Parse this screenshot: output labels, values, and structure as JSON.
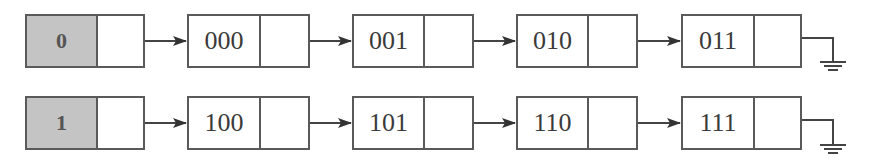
{
  "diagram": {
    "type": "hash-bucket-linked-lists",
    "lists": [
      {
        "head": {
          "label": "0",
          "fill": "#c4c4c4"
        },
        "nodes": [
          {
            "label": "000"
          },
          {
            "label": "001"
          },
          {
            "label": "010"
          },
          {
            "label": "011"
          }
        ],
        "terminator": "ground-null"
      },
      {
        "head": {
          "label": "1",
          "fill": "#c4c4c4"
        },
        "nodes": [
          {
            "label": "100"
          },
          {
            "label": "101"
          },
          {
            "label": "110"
          },
          {
            "label": "111"
          }
        ],
        "terminator": "ground-null"
      }
    ]
  }
}
